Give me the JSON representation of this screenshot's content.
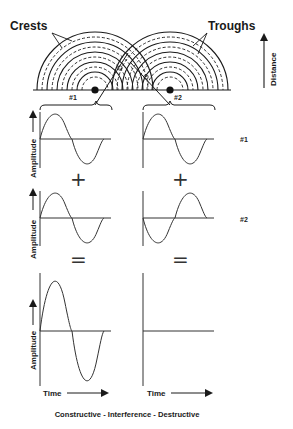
{
  "diagram": {
    "title_caption": "Constructive - Interference - Destructive",
    "colors": {
      "ink": "#1a1a1a",
      "background": "#ffffff"
    },
    "wave_sources": {
      "labels": {
        "crests": "Crests",
        "troughs": "Troughs",
        "distance": "Distance"
      },
      "sources": [
        {
          "id": "#1",
          "label": "#1"
        },
        {
          "id": "#2",
          "label": "#2"
        }
      ]
    },
    "panels": {
      "row_labels": {
        "row1": "#1",
        "row2": "#2"
      },
      "axis": {
        "amplitude": "Amplitude",
        "time": "Time"
      },
      "operators": {
        "plus": "+",
        "equals": "="
      },
      "columns": [
        {
          "name": "constructive",
          "wave1": "sine",
          "wave2": "sine",
          "result": "sine (double amplitude)"
        },
        {
          "name": "destructive",
          "wave1": "sine",
          "wave2": "inverted sine",
          "result": "flat line (zero)"
        }
      ]
    }
  }
}
